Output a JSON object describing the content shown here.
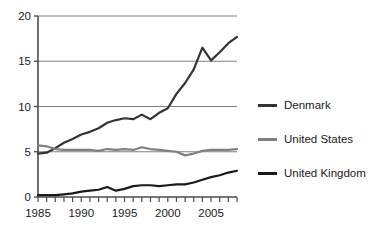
{
  "chart_data": {
    "type": "line",
    "title": "",
    "subtitle": "",
    "xlabel": "",
    "ylabel": "",
    "xlim": [
      1985,
      2008
    ],
    "ylim": [
      0,
      20
    ],
    "grid": "horizontal",
    "legend_position": "right",
    "x": [
      1985,
      1986,
      1987,
      1988,
      1989,
      1990,
      1991,
      1992,
      1993,
      1994,
      1995,
      1996,
      1997,
      1998,
      1999,
      2000,
      2001,
      2002,
      2003,
      2004,
      2005,
      2006,
      2007,
      2008
    ],
    "y_ticks": [
      0,
      5,
      10,
      15,
      20
    ],
    "y_tick_labels": [
      "0",
      "5",
      "10",
      "15",
      "20"
    ],
    "x_ticks": [
      1985,
      1986,
      1987,
      1988,
      1989,
      1990,
      1991,
      1992,
      1993,
      1994,
      1995,
      1996,
      1997,
      1998,
      1999,
      2000,
      2001,
      2002,
      2003,
      2004,
      2005,
      2006,
      2007,
      2008
    ],
    "x_tick_labels": [
      "1985",
      "1990",
      "1995",
      "2000",
      "2005"
    ],
    "x_labeled_ticks": [
      1985,
      1990,
      1995,
      2000,
      2005
    ],
    "series": [
      {
        "name": "Denmark",
        "color": "#333333",
        "width": 2.2,
        "values": [
          4.8,
          4.9,
          5.4,
          6.0,
          6.4,
          6.9,
          7.2,
          7.6,
          8.2,
          8.5,
          8.7,
          8.6,
          9.1,
          8.6,
          9.3,
          9.8,
          11.4,
          12.6,
          14.1,
          16.5,
          15.1,
          16.0,
          17.0,
          17.7
        ]
      },
      {
        "name": "United States",
        "color": "#808080",
        "width": 2.2,
        "values": [
          5.7,
          5.6,
          5.3,
          5.2,
          5.2,
          5.2,
          5.2,
          5.1,
          5.3,
          5.2,
          5.3,
          5.2,
          5.5,
          5.3,
          5.2,
          5.1,
          5.0,
          4.6,
          4.8,
          5.1,
          5.2,
          5.2,
          5.2,
          5.3
        ]
      },
      {
        "name": "United Kingdom",
        "color": "#1a1a1a",
        "width": 2.2,
        "values": [
          0.2,
          0.2,
          0.2,
          0.3,
          0.4,
          0.6,
          0.7,
          0.8,
          1.1,
          0.7,
          0.9,
          1.2,
          1.3,
          1.3,
          1.2,
          1.3,
          1.4,
          1.4,
          1.6,
          1.9,
          2.2,
          2.4,
          2.7,
          2.9
        ]
      }
    ]
  },
  "legend": {
    "items": [
      {
        "label": "Denmark",
        "color": "#333333"
      },
      {
        "label": "United States",
        "color": "#808080"
      },
      {
        "label": "United Kingdom",
        "color": "#1a1a1a"
      }
    ]
  },
  "axes": {
    "axis_color": "#4d4d4d",
    "grid_color": "#808080",
    "plot_left": 38,
    "plot_right": 237,
    "plot_top": 16,
    "plot_bottom": 197
  }
}
